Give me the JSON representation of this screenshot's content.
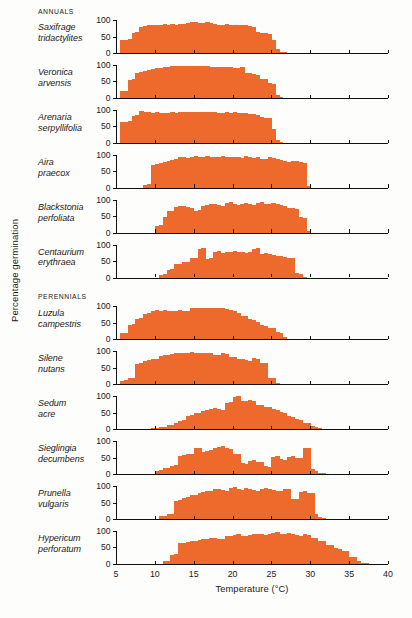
{
  "axis": {
    "y_title": "Percentage germination",
    "x_title": "Temperature (°C)",
    "y_ticks": [
      "0",
      "50",
      "100"
    ],
    "x_ticks": [
      "5",
      "10",
      "15",
      "20",
      "25",
      "30",
      "35",
      "40"
    ]
  },
  "groups": [
    {
      "label": "ANNUALS"
    },
    {
      "label": "PERENNIALS"
    }
  ],
  "colors": {
    "fill": "#ED6A2C",
    "axis": "#111111",
    "background": "#fdfdfb"
  },
  "chart_data": {
    "type": "bar",
    "title": "",
    "subtitle": "",
    "xlabel": "Temperature (°C)",
    "ylabel": "Percentage germination",
    "xlim": [
      5,
      40
    ],
    "ylim": [
      0,
      100
    ],
    "grid": false,
    "legend": null,
    "bin_width": 0.5,
    "panels": [
      {
        "group": "ANNUALS",
        "species": "Saxifrage tridactylites",
        "name_lines": [
          "Saxifrage",
          "tridactylites"
        ],
        "x_start": 5.5,
        "values": [
          40,
          40,
          41,
          62,
          64,
          80,
          82,
          84,
          86,
          86,
          85,
          87,
          86,
          88,
          86,
          87,
          88,
          92,
          93,
          94,
          90,
          92,
          94,
          90,
          88,
          86,
          86,
          87,
          86,
          85,
          84,
          84,
          84,
          82,
          80,
          63,
          62,
          60,
          58,
          40,
          12,
          4,
          2,
          0,
          0
        ]
      },
      {
        "group": "ANNUALS",
        "species": "Veronica arvensis",
        "name_lines": [
          "Veronica",
          "arvensis"
        ],
        "x_start": 5.5,
        "values": [
          20,
          22,
          55,
          58,
          74,
          78,
          82,
          86,
          88,
          90,
          92,
          94,
          95,
          96,
          96,
          96,
          97,
          97,
          97,
          97,
          96,
          96,
          96,
          95,
          95,
          94,
          94,
          93,
          93,
          92,
          92,
          94,
          75,
          74,
          72,
          70,
          58,
          56,
          44,
          42,
          8,
          2,
          0,
          0
        ]
      },
      {
        "group": "ANNUALS",
        "species": "Arenaria serpyllifolia",
        "name_lines": [
          "Arenaria",
          "serpyllifolia"
        ],
        "x_start": 5.5,
        "values": [
          62,
          64,
          66,
          82,
          84,
          96,
          94,
          92,
          90,
          92,
          90,
          91,
          90,
          92,
          91,
          93,
          92,
          93,
          94,
          93,
          92,
          93,
          92,
          94,
          92,
          91,
          90,
          92,
          91,
          92,
          91,
          90,
          90,
          88,
          86,
          84,
          78,
          76,
          74,
          42,
          8,
          2,
          0
        ]
      },
      {
        "group": "ANNUALS",
        "species": "Aira praecox",
        "name_lines": [
          "Aira",
          "praecox"
        ],
        "x_start": 8.5,
        "values": [
          8,
          10,
          70,
          72,
          74,
          78,
          80,
          84,
          86,
          92,
          94,
          90,
          92,
          96,
          94,
          92,
          96,
          94,
          92,
          94,
          96,
          94,
          92,
          94,
          92,
          90,
          96,
          94,
          90,
          92,
          88,
          86,
          92,
          90,
          86,
          84,
          80,
          78,
          82,
          80,
          78,
          76,
          4,
          0
        ]
      },
      {
        "group": "ANNUALS",
        "species": "Blackstonia perfoliata",
        "name_lines": [
          "Blackstonia",
          "perfoliata"
        ],
        "x_start": 10.0,
        "values": [
          20,
          22,
          46,
          64,
          66,
          78,
          80,
          82,
          78,
          76,
          66,
          68,
          82,
          84,
          86,
          88,
          84,
          82,
          90,
          92,
          86,
          84,
          88,
          90,
          86,
          84,
          90,
          92,
          88,
          86,
          90,
          88,
          84,
          82,
          76,
          74,
          72,
          46,
          44,
          4,
          0
        ]
      },
      {
        "group": "ANNUALS",
        "species": "Centaurium erythraea",
        "name_lines": [
          "Centaurium",
          "erythraea"
        ],
        "x_start": 10.5,
        "values": [
          8,
          10,
          22,
          26,
          40,
          42,
          46,
          48,
          58,
          60,
          86,
          88,
          56,
          58,
          78,
          80,
          74,
          76,
          78,
          80,
          76,
          78,
          74,
          76,
          86,
          88,
          72,
          74,
          70,
          68,
          66,
          64,
          62,
          60,
          58,
          14,
          12,
          2,
          0
        ]
      },
      {
        "group": "PERENNIALS",
        "species": "Luzula campestris",
        "name_lines": [
          "Luzula",
          "campestris"
        ],
        "x_start": 5.5,
        "values": [
          18,
          20,
          44,
          46,
          62,
          64,
          78,
          80,
          86,
          88,
          86,
          88,
          86,
          87,
          86,
          88,
          87,
          86,
          94,
          96,
          94,
          95,
          94,
          96,
          94,
          95,
          94,
          92,
          88,
          86,
          80,
          72,
          70,
          62,
          60,
          52,
          44,
          42,
          36,
          34,
          22,
          20,
          8,
          2,
          0
        ]
      },
      {
        "group": "PERENNIALS",
        "species": "Silene nutans",
        "name_lines": [
          "Silene",
          "nutans"
        ],
        "x_start": 5.5,
        "values": [
          10,
          12,
          18,
          20,
          62,
          64,
          72,
          74,
          76,
          78,
          86,
          88,
          90,
          92,
          94,
          96,
          94,
          96,
          97,
          96,
          95,
          96,
          94,
          96,
          88,
          90,
          94,
          92,
          84,
          82,
          78,
          76,
          74,
          72,
          80,
          78,
          66,
          64,
          20,
          18,
          4,
          0
        ]
      },
      {
        "group": "PERENNIALS",
        "species": "Sedum acre",
        "name_lines": [
          "Sedum",
          "acre"
        ],
        "x_start": 9.0,
        "values": [
          2,
          3,
          4,
          6,
          8,
          12,
          14,
          20,
          26,
          28,
          40,
          42,
          48,
          50,
          56,
          58,
          62,
          64,
          60,
          58,
          80,
          82,
          98,
          100,
          84,
          86,
          88,
          84,
          72,
          74,
          68,
          66,
          60,
          58,
          52,
          50,
          40,
          38,
          30,
          28,
          20,
          18,
          10,
          6,
          3,
          2,
          0
        ]
      },
      {
        "group": "PERENNIALS",
        "species": "Sieglingia decumbens",
        "name_lines": [
          "Sieglingia",
          "decumbens"
        ],
        "x_start": 10.0,
        "values": [
          10,
          12,
          18,
          20,
          26,
          28,
          56,
          58,
          60,
          62,
          78,
          80,
          68,
          70,
          72,
          80,
          82,
          84,
          78,
          76,
          62,
          60,
          34,
          32,
          40,
          42,
          38,
          36,
          24,
          22,
          52,
          54,
          46,
          44,
          52,
          54,
          50,
          48,
          78,
          80,
          14,
          10,
          4,
          2,
          0
        ]
      },
      {
        "group": "PERENNIALS",
        "species": "Prunella vulgaris",
        "name_lines": [
          "Prunella",
          "vulgaris"
        ],
        "x_start": 10.5,
        "values": [
          8,
          10,
          14,
          16,
          56,
          58,
          64,
          66,
          72,
          74,
          80,
          82,
          84,
          86,
          90,
          92,
          88,
          86,
          94,
          96,
          90,
          88,
          94,
          92,
          88,
          86,
          92,
          94,
          90,
          88,
          84,
          86,
          92,
          90,
          62,
          60,
          82,
          84,
          80,
          78,
          14,
          6,
          2,
          0
        ]
      },
      {
        "group": "PERENNIALS",
        "species": "Hypericum perforatum",
        "name_lines": [
          "Hypericum",
          "perforatum"
        ],
        "x_start": 11.0,
        "values": [
          8,
          10,
          28,
          30,
          62,
          64,
          66,
          68,
          70,
          72,
          74,
          76,
          78,
          80,
          76,
          74,
          84,
          86,
          88,
          90,
          86,
          84,
          88,
          90,
          92,
          90,
          88,
          92,
          94,
          96,
          92,
          90,
          94,
          92,
          88,
          86,
          90,
          88,
          80,
          78,
          70,
          68,
          58,
          56,
          48,
          46,
          40,
          38,
          22,
          20,
          10,
          4,
          2,
          0
        ]
      }
    ]
  }
}
